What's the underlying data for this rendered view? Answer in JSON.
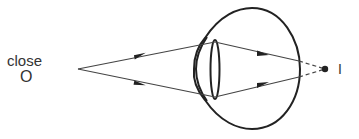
{
  "labels": {
    "object_caption": "close",
    "object_symbol": "O",
    "image_symbol": "I"
  },
  "diagram": {
    "type": "ray-diagram",
    "colors": {
      "stroke": "#222222",
      "text": "#333333",
      "background": "#ffffff"
    },
    "object_point": [
      78,
      69
    ],
    "image_point": [
      325,
      69
    ],
    "rays": [
      {
        "from": [
          78,
          69
        ],
        "via_lens": [
          215,
          42
        ],
        "retina_hit": [
          299,
          61
        ],
        "to": [
          325,
          69
        ],
        "beyond_retina": "dashed"
      },
      {
        "from": [
          78,
          69
        ],
        "via_lens": [
          215,
          97
        ],
        "retina_hit": [
          299,
          77
        ],
        "to": [
          325,
          69
        ],
        "beyond_retina": "dashed"
      }
    ]
  }
}
